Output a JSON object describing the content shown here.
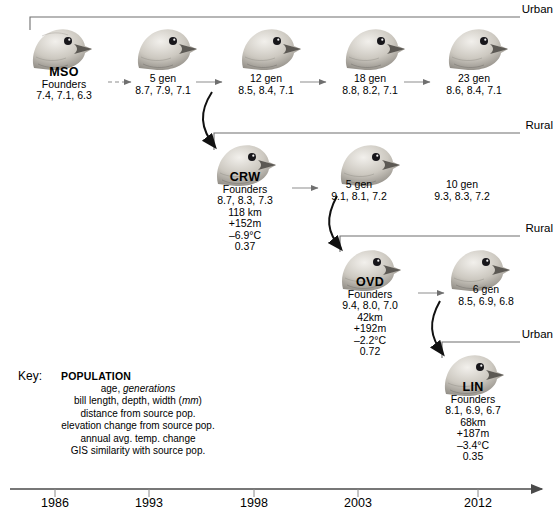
{
  "figure": {
    "axis": {
      "ticks": [
        "1986",
        "1993",
        "1998",
        "2003",
        "2012"
      ],
      "arrow_direction": "right"
    },
    "habitat_labels": [
      {
        "text": "Urban",
        "lane": 1
      },
      {
        "text": "Rural",
        "lane": 2
      },
      {
        "text": "Rural",
        "lane": 3
      },
      {
        "text": "Urban",
        "lane": 4
      }
    ],
    "populations": [
      {
        "id": "MSO",
        "name": "MSO",
        "age_label": "Founders",
        "bill": "7.4, 7.1, 6.3",
        "distance": null,
        "elevation": null,
        "temp": null,
        "gis": null
      },
      {
        "id": "CRW",
        "name": "CRW",
        "age_label": "Founders",
        "bill": "8.7, 8.3, 7.3",
        "distance": "118 km",
        "elevation": "+152m",
        "temp": "–6.9°C",
        "gis": "0.37"
      },
      {
        "id": "OVD",
        "name": "OVD",
        "age_label": "Founders",
        "bill": "9.4, 8.0, 7.0",
        "distance": "42km",
        "elevation": "+192m",
        "temp": "–2.2°C",
        "gis": "0.72"
      },
      {
        "id": "LIN",
        "name": "LIN",
        "age_label": "Founders",
        "bill": "8.1, 6.9, 6.7",
        "distance": "68km",
        "elevation": "+187m",
        "temp": "–3.4°C",
        "gis": "0.35"
      }
    ],
    "generations": [
      {
        "lane": 1,
        "gen": "5 gen",
        "bill": "8.7, 7.9, 7.1"
      },
      {
        "lane": 1,
        "gen": "12 gen",
        "bill": "8.5, 8.4, 7.1"
      },
      {
        "lane": 1,
        "gen": "18 gen",
        "bill": "8.8, 8.2, 7.1"
      },
      {
        "lane": 1,
        "gen": "23 gen",
        "bill": "8.6, 8.4, 7.1"
      },
      {
        "lane": 2,
        "gen": "5 gen",
        "bill": "9.1, 8.1, 7.2"
      },
      {
        "lane": 2,
        "gen": "10 gen",
        "bill": "9.3, 8.3, 7.2"
      },
      {
        "lane": 3,
        "gen": "6 gen",
        "bill": "8.5, 6.9, 6.8"
      }
    ],
    "key": {
      "label": "Key:",
      "population_header": "POPULATION",
      "rows": [
        {
          "pre": "age, ",
          "em": "generations",
          "post": ""
        },
        {
          "pre": "bill length, depth, width (",
          "em": "mm",
          "post": ")"
        },
        {
          "pre": "distance from source pop.",
          "em": "",
          "post": ""
        },
        {
          "pre": "elevation change from source pop.",
          "em": "",
          "post": ""
        },
        {
          "pre": "annual avg. temp. change",
          "em": "",
          "post": ""
        },
        {
          "pre": "GIS similarity with source pop.",
          "em": "",
          "post": ""
        }
      ]
    },
    "colors": {
      "ink": "#000000",
      "rule": "#8a8a8a",
      "bird_light": "#e9e7e2",
      "bird_mid": "#b6b2aa",
      "bird_dark": "#6d6a64",
      "beak": "#55524c"
    }
  }
}
